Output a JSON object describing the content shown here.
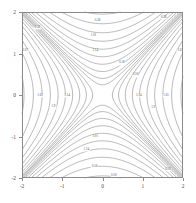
{
  "chart_data": {
    "type": "line",
    "subtype": "contour",
    "title": "",
    "xlabel": "",
    "ylabel": "",
    "xlim": [
      -2,
      2
    ],
    "ylim": [
      -2,
      2
    ],
    "xticks": [
      -2,
      -1,
      0,
      1,
      2
    ],
    "yticks": [
      -2,
      -1,
      0,
      1,
      2
    ],
    "xtick_labels": [
      "-2",
      "-1",
      "0",
      "1",
      "2"
    ],
    "ytick_labels": [
      "-2",
      "-1",
      "0",
      "1",
      "2"
    ],
    "grid": false,
    "legend": false,
    "frame": true,
    "line_color": "#6e6e6e",
    "contour_labels": [
      {
        "text": "0.58",
        "x": -1.62,
        "y": 1.62
      },
      {
        "text": "0.58",
        "x": -0.12,
        "y": 1.78
      },
      {
        "text": "0.58",
        "x": 1.52,
        "y": 1.86
      },
      {
        "text": "1.01",
        "x": -0.22,
        "y": 1.42
      },
      {
        "text": "1.14",
        "x": -0.18,
        "y": 1.05
      },
      {
        "text": "1.67",
        "x": -1.92,
        "y": 1.06
      },
      {
        "text": "1.67",
        "x": 1.93,
        "y": 1.06
      },
      {
        "text": "0.58",
        "x": 0.48,
        "y": 0.76
      },
      {
        "text": "0.58",
        "x": 0.82,
        "y": 0.47
      },
      {
        "text": "1.61",
        "x": -1.55,
        "y": -0.02
      },
      {
        "text": "1.14",
        "x": -0.88,
        "y": -0.02
      },
      {
        "text": "1.14",
        "x": 0.9,
        "y": -0.03
      },
      {
        "text": "1.61",
        "x": 1.58,
        "y": -0.03
      },
      {
        "text": "1.9",
        "x": -1.22,
        "y": -0.3
      },
      {
        "text": "1.9",
        "x": 1.26,
        "y": -0.31
      },
      {
        "text": "1.01",
        "x": -0.18,
        "y": -1.02
      },
      {
        "text": "1.14",
        "x": -0.4,
        "y": -1.33
      },
      {
        "text": "0.58",
        "x": -0.2,
        "y": -1.74
      },
      {
        "text": "0.58",
        "x": 0.28,
        "y": -1.95
      },
      {
        "text": "0.58",
        "x": 1.62,
        "y": -1.8
      }
    ]
  },
  "axes": {
    "x_tick_labels": [
      "-2",
      "-1",
      "0",
      "1",
      "2"
    ],
    "y_tick_labels": [
      "-2",
      "-1",
      "0",
      "1",
      "2"
    ]
  }
}
